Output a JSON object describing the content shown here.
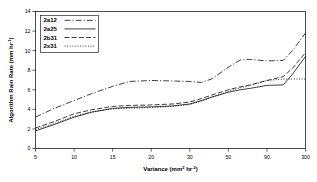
{
  "chart_data": {
    "type": "line",
    "title": "",
    "xlabel": "Variance (mm2 hr-2)",
    "xlabel_base": "Variance (mm",
    "xlabel_sup1": "2",
    "xlabel_mid": " hr",
    "xlabel_sup2": "-2",
    "xlabel_end": ")",
    "ylabel": "Algorithm Rain Rate (mm hr-1)",
    "ylabel_base": "Algorithm Rain Rate (mm hr",
    "ylabel_sup": "-1",
    "ylabel_end": ")",
    "x_tick_labels": [
      "5",
      "10",
      "15",
      "20",
      "30",
      "50",
      "90",
      "300"
    ],
    "x_tick_values": [
      5,
      10,
      15,
      20,
      30,
      50,
      90,
      300
    ],
    "y_tick_labels": [
      "0",
      "2",
      "4",
      "6",
      "8",
      "10",
      "12",
      "14"
    ],
    "y_tick_values": [
      0,
      2,
      4,
      6,
      8,
      10,
      12,
      14
    ],
    "ylim": [
      0,
      14
    ],
    "grid": false,
    "legend_position": "top-left",
    "x_scale": "ordinal-log",
    "series": [
      {
        "name": "2a12",
        "style": "dash-dot",
        "dasharray": "6,2,1.2,2",
        "x": [
          5,
          7,
          10,
          12,
          15,
          17,
          20,
          25,
          30,
          35,
          40,
          50,
          60,
          70,
          90,
          150,
          200,
          300
        ],
        "values": [
          3.2,
          4.1,
          4.9,
          5.6,
          6.35,
          6.85,
          6.95,
          6.9,
          6.85,
          6.75,
          7.1,
          8.3,
          9.05,
          9.1,
          8.95,
          9.0,
          10.0,
          11.8
        ]
      },
      {
        "name": "2a25",
        "style": "solid",
        "dasharray": "none",
        "x": [
          5,
          7,
          10,
          12,
          15,
          17,
          20,
          25,
          30,
          35,
          40,
          50,
          60,
          70,
          90,
          150,
          200,
          300
        ],
        "values": [
          1.8,
          2.45,
          3.2,
          3.7,
          4.1,
          4.2,
          4.25,
          4.35,
          4.55,
          4.9,
          5.25,
          5.75,
          6.0,
          6.15,
          6.45,
          6.5,
          7.6,
          9.4
        ]
      },
      {
        "name": "2b31",
        "style": "long-dash",
        "dasharray": "5,2.2",
        "x": [
          5,
          7,
          10,
          12,
          15,
          17,
          20,
          25,
          30,
          35,
          40,
          50,
          60,
          70,
          90,
          150,
          200,
          300
        ],
        "values": [
          2.1,
          2.75,
          3.55,
          3.95,
          4.3,
          4.4,
          4.45,
          4.55,
          4.75,
          5.1,
          5.45,
          6.0,
          6.3,
          6.5,
          6.95,
          7.35,
          8.2,
          9.8
        ]
      },
      {
        "name": "2x31",
        "style": "dotted",
        "dasharray": "1,1.6",
        "x": [
          5,
          7,
          10,
          12,
          15,
          17,
          20,
          25,
          30,
          35,
          40,
          50,
          60,
          70,
          90,
          150,
          200,
          300
        ],
        "values": [
          1.95,
          2.55,
          3.3,
          3.75,
          4.05,
          4.12,
          4.18,
          4.3,
          4.5,
          4.85,
          5.2,
          5.85,
          6.2,
          6.45,
          6.95,
          7.1,
          7.1,
          7.1
        ]
      }
    ]
  }
}
